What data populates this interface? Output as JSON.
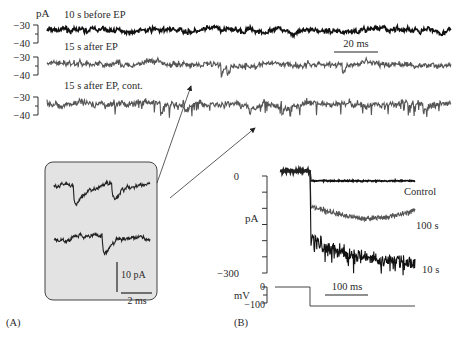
{
  "figure": {
    "panel_a_label": "(A)",
    "panel_b_label": "(B)"
  },
  "chart_data": [
    {
      "type": "line",
      "panel": "A",
      "ylabel": "pA",
      "scale_bar_x": "20 ms",
      "traces": [
        {
          "name": "10 s before EP",
          "color": "#111111",
          "ylim": [
            -40,
            -30
          ],
          "yticks": [
            "-30",
            "-40"
          ],
          "baseline": -33,
          "noise": 1.2,
          "events": []
        },
        {
          "name": "15 s after EP",
          "color": "#555555",
          "ylim": [
            -40,
            -30
          ],
          "yticks": [
            "-30",
            "-40"
          ],
          "baseline": -34,
          "noise": 1.6,
          "events": [
            {
              "t": 0.43,
              "amp": -9
            },
            {
              "t": 0.445,
              "amp": -8
            },
            {
              "t": 0.73,
              "amp": -9
            }
          ]
        },
        {
          "name": "15 s after EP, cont.",
          "color": "#555555",
          "ylim": [
            -40,
            -30
          ],
          "yticks": [
            "-30",
            "-40"
          ],
          "baseline": -34,
          "noise": 1.8,
          "events": [
            {
              "t": 0.28,
              "amp": -10
            },
            {
              "t": 0.34,
              "amp": -6
            },
            {
              "t": 0.5,
              "amp": -8
            },
            {
              "t": 0.58,
              "amp": -7
            },
            {
              "t": 0.93,
              "amp": -9
            }
          ]
        }
      ]
    },
    {
      "type": "line",
      "panel": "A-inset",
      "scale_bar_y": "10 pA",
      "scale_bar_x": "2 ms",
      "traces": [
        {
          "name": "inset-trace-1",
          "color": "#222222",
          "events": [
            {
              "t": 0.2,
              "amp": -16
            },
            {
              "t": 0.6,
              "amp": -12
            }
          ]
        },
        {
          "name": "inset-trace-2",
          "color": "#222222",
          "events": [
            {
              "t": 0.5,
              "amp": -16
            }
          ]
        }
      ]
    },
    {
      "type": "line",
      "panel": "B",
      "ylabel": "pA",
      "ylim": [
        -300,
        0
      ],
      "yticks": [
        "0",
        "-300"
      ],
      "voltage_ylabel": "mV",
      "voltage_yticks": [
        "0",
        "-100"
      ],
      "voltage_step": {
        "from": 0,
        "to": -100
      },
      "scale_bar_x": "100 ms",
      "traces": [
        {
          "name": "Control",
          "color": "#111111",
          "steady_pA": -15
        },
        {
          "name": "100 s",
          "color": "#555555",
          "steady_pA": -100,
          "dip_pA": -135
        },
        {
          "name": "10 s",
          "color": "#111111",
          "steady_pA": -240,
          "peak_pA": -310
        }
      ]
    }
  ]
}
